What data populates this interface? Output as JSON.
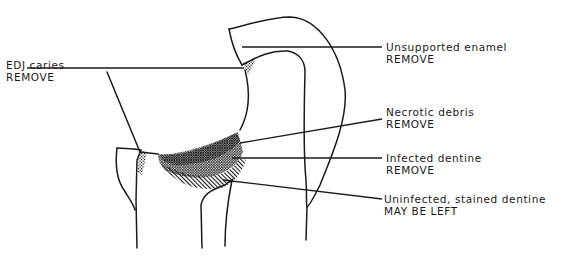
{
  "figure": {
    "type": "cross-section diagram of carious tooth cavity",
    "labels": [
      {
        "id": "edj-caries",
        "line1": "EDJ caries",
        "line2": "REMOVE"
      },
      {
        "id": "unsupported-enamel",
        "line1": "Unsupported enamel",
        "line2": "REMOVE"
      },
      {
        "id": "necrotic-debris",
        "line1": "Necrotic debris",
        "line2": "REMOVE"
      },
      {
        "id": "infected-dentine",
        "line1": "Infected dentine",
        "line2": "REMOVE"
      },
      {
        "id": "uninfected-dentine",
        "line1": "Uninfected, stained dentine",
        "line2": "MAY BE LEFT"
      }
    ]
  },
  "colors": {
    "line": "#1a1a1a",
    "background": "#ffffff"
  }
}
